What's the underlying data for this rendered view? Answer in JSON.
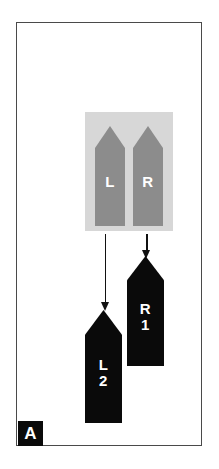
{
  "figure": {
    "panel_label": "A",
    "background_color": "#ffffff",
    "frame_color": "#4a4a4a",
    "inset_box_color": "#d7d7d7",
    "source_shape_color": "#8c8c8c",
    "result_shape_color": "#0a0a0a",
    "arrow_color": "#111111"
  },
  "source_group": {
    "name": "paired-gray-blocks",
    "shapes": [
      {
        "id": "L",
        "label": "L",
        "fill": "#8c8c8c",
        "text_color": "#ffffff"
      },
      {
        "id": "R",
        "label": "R",
        "fill": "#8c8c8c",
        "text_color": "#ffffff"
      }
    ]
  },
  "arrows": [
    {
      "id": "left-arrow",
      "from": "L",
      "to": "L2",
      "direction": "down"
    },
    {
      "id": "right-arrow",
      "from": "R",
      "to": "R1",
      "direction": "down"
    }
  ],
  "result_group": {
    "name": "black-result-blocks",
    "shapes": [
      {
        "id": "R1",
        "lines": [
          "R",
          "1"
        ],
        "line1": "R",
        "line2": "1",
        "fill": "#0a0a0a",
        "text_color": "#ffffff"
      },
      {
        "id": "L2",
        "lines": [
          "L",
          "2"
        ],
        "line1": "L",
        "line2": "2",
        "fill": "#0a0a0a",
        "text_color": "#ffffff"
      }
    ]
  }
}
